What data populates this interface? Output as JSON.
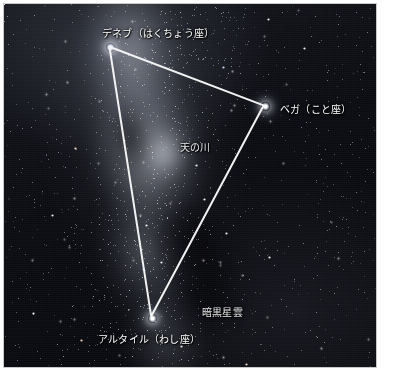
{
  "photo": {
    "caption_language": "ja",
    "scene": "summer-triangle-night-sky",
    "border_color": "#c9c9c9",
    "background_color": "#ffffff"
  },
  "labels": {
    "deneb": "デネブ（はくちょう座）",
    "vega": "ベガ（こと座）",
    "altair": "アルタイル（わし座）",
    "milky_way": "天の川",
    "dark_nebula": "暗黒星雲"
  },
  "stars": [
    {
      "name": "deneb",
      "label": "デネブ（はくちょう座）",
      "x": 110,
      "y": 47
    },
    {
      "name": "vega",
      "label": "ベガ（こと座）",
      "x": 265,
      "y": 106
    },
    {
      "name": "altair",
      "label": "アルタイル（わし座）",
      "x": 152,
      "y": 318
    }
  ],
  "triangle": {
    "name": "summer-triangle",
    "line_color": "#f2f2f2",
    "line_width": 2,
    "vertices": [
      {
        "star": "deneb",
        "x": 110,
        "y": 47
      },
      {
        "star": "vega",
        "x": 265,
        "y": 106
      },
      {
        "star": "altair",
        "x": 152,
        "y": 318
      }
    ]
  },
  "annotations": [
    {
      "name": "milky-way",
      "text": "天の川",
      "x": 176,
      "y": 138
    },
    {
      "name": "dark-nebula",
      "text": "暗黒星雲",
      "x": 198,
      "y": 303
    }
  ]
}
